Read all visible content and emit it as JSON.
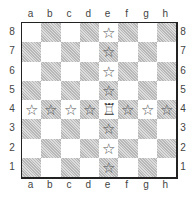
{
  "diagram": {
    "files": [
      "a",
      "b",
      "c",
      "d",
      "e",
      "f",
      "g",
      "h"
    ],
    "ranks": [
      "8",
      "7",
      "6",
      "5",
      "4",
      "3",
      "2",
      "1"
    ],
    "piece": {
      "type": "rook",
      "color": "white",
      "square": "e4",
      "glyph": "♖"
    },
    "marker": {
      "name": "star",
      "glyph": "☆"
    },
    "marked_squares": [
      "e8",
      "e7",
      "e6",
      "e5",
      "e3",
      "e2",
      "e1",
      "a4",
      "b4",
      "c4",
      "d4",
      "f4",
      "g4",
      "h4"
    ],
    "colors": {
      "light_square": "#ffffff",
      "dark_square": "#c8c8c8",
      "border": "#222222"
    }
  }
}
